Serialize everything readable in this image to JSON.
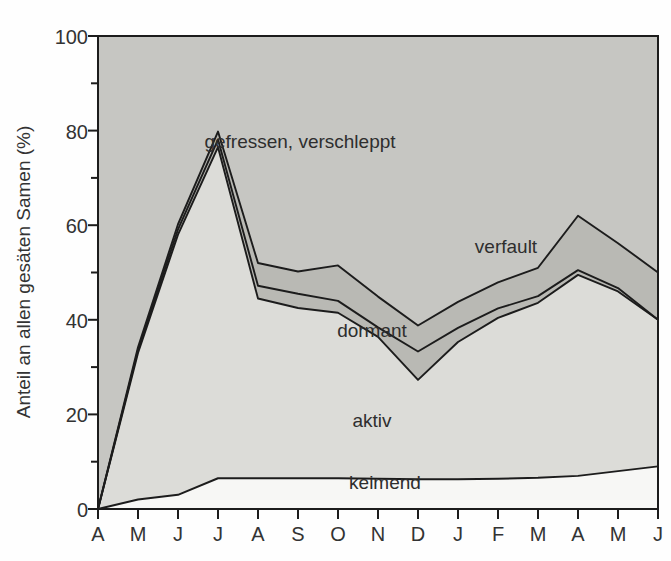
{
  "chart_data": {
    "type": "area",
    "stacked": true,
    "title": "",
    "subtitle": "",
    "xlabel": "",
    "ylabel": "Anteil an allen gesäten Samen (%)",
    "x": [
      "A",
      "M",
      "J",
      "J",
      "A",
      "S",
      "O",
      "N",
      "D",
      "J",
      "F",
      "M",
      "A",
      "M",
      "J"
    ],
    "x_tick_labels": [
      "A",
      "M",
      "J",
      "J",
      "A",
      "S",
      "O",
      "N",
      "D",
      "J",
      "F",
      "M",
      "A",
      "M",
      "J"
    ],
    "y_tick_labels": [
      "0",
      "20",
      "40",
      "60",
      "80",
      "100"
    ],
    "y_ticks_major": [
      0,
      20,
      40,
      60,
      80,
      100
    ],
    "y_ticks_minor": [
      10,
      30,
      50,
      70,
      90
    ],
    "ylim": [
      0,
      100
    ],
    "grid": false,
    "legend_position": "inline-annotations",
    "series": [
      {
        "name": "keimend",
        "label": "keimend",
        "color": "#f7f7f5",
        "values": [
          0,
          2.0,
          3.0,
          6.5,
          6.5,
          6.5,
          6.5,
          6.4,
          6.3,
          6.3,
          6.4,
          6.6,
          7.0,
          8.0,
          9.0
        ]
      },
      {
        "name": "aktiv",
        "label": "aktiv",
        "color": "#dcdcd8",
        "values": [
          0,
          31.0,
          55.0,
          70.0,
          38.0,
          36.0,
          35.0,
          30.0,
          21.0,
          29.0,
          34.0,
          37.0,
          42.5,
          38.0,
          31.0
        ]
      },
      {
        "name": "dormant",
        "label": "dormant",
        "color": "#b9b9b4",
        "values": [
          0,
          0.6,
          1.1,
          1.6,
          2.7,
          3.0,
          2.5,
          2.0,
          6.0,
          3.0,
          2.0,
          1.4,
          1.0,
          0.7,
          0.0
        ]
      },
      {
        "name": "verfault",
        "label": "verfault",
        "color": "#b9b9b4",
        "values": [
          0,
          0.6,
          1.1,
          1.7,
          4.8,
          4.7,
          7.5,
          6.5,
          5.5,
          5.5,
          5.5,
          6.0,
          11.5,
          9.5,
          10.0
        ]
      },
      {
        "name": "gefressen, verschleppt",
        "label": "gefressen, verschleppt",
        "color": "#c6c6c2",
        "values": [
          100,
          65.8,
          39.8,
          20.2,
          48.0,
          49.8,
          48.5,
          55.1,
          61.2,
          56.2,
          52.1,
          49.0,
          38.0,
          43.8,
          50.0
        ]
      }
    ],
    "cumulative_tops": {
      "keimend": [
        0,
        2.0,
        3.0,
        6.5,
        6.5,
        6.5,
        6.5,
        6.4,
        6.3,
        6.3,
        6.4,
        6.6,
        7.0,
        8.0,
        9.0
      ],
      "aktiv": [
        0,
        33.0,
        58.0,
        76.5,
        44.5,
        42.5,
        41.5,
        36.4,
        27.3,
        35.3,
        40.4,
        43.6,
        49.5,
        46.0,
        40.0
      ],
      "dormant": [
        0,
        33.6,
        59.1,
        78.1,
        47.2,
        45.5,
        44.0,
        38.4,
        33.3,
        38.3,
        42.4,
        45.0,
        50.5,
        46.7,
        40.0
      ],
      "verfault": [
        0,
        34.2,
        60.2,
        79.8,
        52.0,
        50.2,
        51.5,
        44.9,
        38.8,
        43.8,
        47.9,
        51.0,
        62.0,
        56.2,
        50.0
      ],
      "gefressen": [
        100,
        100,
        100,
        100,
        100,
        100,
        100,
        100,
        100,
        100,
        100,
        100,
        100,
        100,
        100
      ]
    },
    "annotations": [
      {
        "name": "gefressen-verschleppt",
        "text": "gefressen, verschleppt",
        "x_px": 300,
        "y_px": 148
      },
      {
        "name": "verfault",
        "text": "verfault",
        "x_px": 506,
        "y_px": 253
      },
      {
        "name": "dormant",
        "text": "dormant",
        "x_px": 372,
        "y_px": 337
      },
      {
        "name": "aktiv",
        "text": "aktiv",
        "x_px": 372,
        "y_px": 427
      },
      {
        "name": "keimend",
        "text": "keimend",
        "x_px": 385,
        "y_px": 489
      }
    ]
  },
  "axes": {
    "y_title": "Anteil an allen gesäten Samen (%)",
    "y_labels": {
      "v100": "100",
      "v80": "80",
      "v60": "60",
      "v40": "40",
      "v20": "20",
      "v0": "0"
    },
    "x_labels": {
      "m0": "A",
      "m1": "M",
      "m2": "J",
      "m3": "J",
      "m4": "A",
      "m5": "S",
      "m6": "O",
      "m7": "N",
      "m8": "D",
      "m9": "J",
      "m10": "F",
      "m11": "M",
      "m12": "A",
      "m13": "M",
      "m14": "J"
    }
  },
  "colors": {
    "band_keimend": "#f7f7f5",
    "band_aktiv": "#dcdcd8",
    "band_dormant": "#b9b9b4",
    "band_verfault": "#b9b9b4",
    "band_gefressen": "#c6c6c2",
    "axis": "#1c1c1c",
    "line": "#1c1c1c",
    "text": "#333333",
    "background": "#fefefe"
  }
}
